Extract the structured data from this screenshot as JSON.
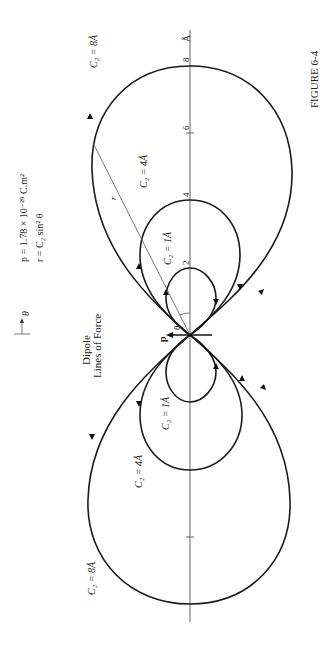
{
  "figure": {
    "caption": "FIGURE 6-4",
    "title_line1": "Dipole",
    "title_line2": "Lines of Force",
    "theta_symbol": "θ",
    "equation_p": "p = 1.78 × 10⁻²⁹ C.m²",
    "equation_r": "r = C₂ sin² θ",
    "axis_unit": "Å",
    "dipole_label": "p",
    "angle_label": "θ",
    "radius_label": "r",
    "axis_ticks": [
      "2",
      "4",
      "6",
      "8"
    ],
    "curve_labels": {
      "upper_8": "C₂ = 8Å",
      "upper_4": "C₂ = 4Å",
      "upper_1": "C₂ = 1Å",
      "lower_8": "C₂ = 8Å",
      "lower_4": "C₂ = 4Å",
      "lower_1": "C₂ = 1Å"
    }
  }
}
